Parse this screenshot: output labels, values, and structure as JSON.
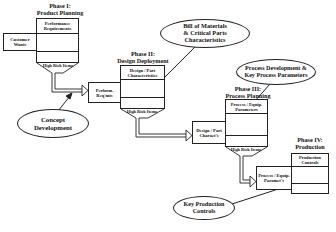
{
  "diagram": {
    "type": "QFD four-phase cascade",
    "phases": [
      {
        "title_line1": "Phase I:",
        "title_line2": "Product Planning",
        "matrix_header": "Performance Requirements",
        "side_input": "Customer Wants",
        "output_label": "High Risk Items"
      },
      {
        "title_line1": "Phase II:",
        "title_line2": "Design Deployment",
        "matrix_header": "Design / Part Characteristics",
        "side_input": "Perform. Req'mts",
        "output_label": "High Risk Items"
      },
      {
        "title_line1": "Phase III:",
        "title_line2": "Process Planning",
        "matrix_header": "Process / Equip. Parameters",
        "side_input": "Design / Part Charact's",
        "output_label": "High Risk Items"
      },
      {
        "title_line1": "Phase IV:",
        "title_line2": "Production",
        "matrix_header": "Production Controls",
        "side_input": "Process / Equip. Paramet's"
      }
    ],
    "callouts": [
      {
        "id": "concept",
        "line1": "Concept",
        "line2": "Development"
      },
      {
        "id": "bom",
        "line1": "Bill of Materials",
        "line2": "& Critical Parts",
        "line3": "Characteristics"
      },
      {
        "id": "process_dev",
        "line1": "Process Development &",
        "line2": "Key Process Parameters"
      },
      {
        "id": "key_prod",
        "line1": "Key Production",
        "line2": "Controls"
      }
    ]
  }
}
